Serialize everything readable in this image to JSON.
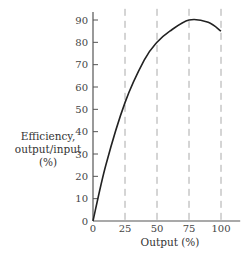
{
  "chart_data": {
    "type": "line",
    "title": "",
    "xlabel": "Output (%)",
    "ylabel": "Efficiency, output/input (%)",
    "ylabel_lines": [
      "Efficiency,",
      "output/input",
      "(%)"
    ],
    "x_ticks": [
      0,
      25,
      50,
      75,
      100
    ],
    "y_ticks": [
      0,
      10,
      20,
      30,
      40,
      50,
      60,
      70,
      80,
      90
    ],
    "xlim": [
      0,
      115
    ],
    "ylim": [
      0,
      95
    ],
    "grid": "vertical dashed at x=25,50,75,100",
    "series": [
      {
        "name": "Efficiency",
        "x": [
          0,
          10,
          25,
          40,
          50,
          60,
          75,
          90,
          100
        ],
        "y": [
          0,
          25,
          53,
          72,
          80,
          85,
          90,
          89,
          85
        ]
      }
    ]
  }
}
